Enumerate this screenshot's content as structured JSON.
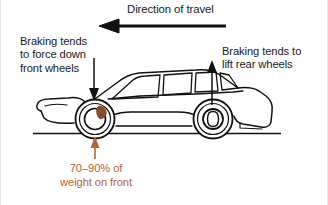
{
  "figure": {
    "width": 328,
    "height": 205,
    "background": "#ffffff"
  },
  "colors": {
    "ink": "#1a1a1a",
    "outline": "#111111",
    "accent_orange": "#b5653a",
    "caliper_brown": "#8a4b2a",
    "ground": "#111111",
    "border": "#e3e3e3"
  },
  "labels": {
    "direction_of_travel": "Direction of travel",
    "front_note": "Braking tends\nto force down\nfront wheels",
    "rear_note": "Braking tends to\nlift rear wheels",
    "weight_note": "70–90% of\nweight on front"
  },
  "annotations": {
    "travel_arrow": {
      "name": "direction-of-travel-arrow",
      "direction": "left",
      "x_start": 226,
      "x_end": 99,
      "y": 26,
      "color": "#111111"
    },
    "front_arrow": {
      "name": "front-down-arrow",
      "direction": "down",
      "x": 94,
      "y_start": 58,
      "y_end": 101,
      "color": "#111111"
    },
    "rear_arrow": {
      "name": "rear-up-arrow",
      "direction": "up",
      "x": 212,
      "y_start": 105,
      "y_end": 61,
      "color": "#111111"
    },
    "weight_arrow": {
      "name": "weight-up-arrow",
      "direction": "up",
      "x": 95,
      "y_start": 158,
      "y_end": 137,
      "color": "#b5653a"
    }
  },
  "vehicle": {
    "name": "car-side-view",
    "facing": "left",
    "ground_line": {
      "x_start": 33,
      "x_end": 281,
      "y": 133
    },
    "front_wheel": {
      "cx": 95,
      "cy": 119,
      "r_outer": 20,
      "r_inner": 12
    },
    "rear_wheel": {
      "cx": 213,
      "cy": 119,
      "r_outer": 20,
      "r_inner": 12
    },
    "brake_caliper": {
      "name": "front-brake-caliper",
      "cx": 101,
      "cy": 113
    }
  }
}
